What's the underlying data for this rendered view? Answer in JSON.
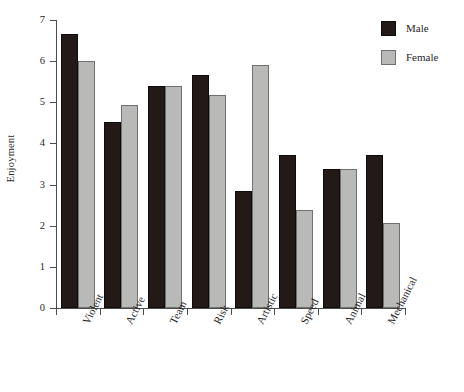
{
  "chart_data": {
    "type": "bar",
    "title": "",
    "subtitle": "",
    "xlabel": "",
    "ylabel": "Enjoyment",
    "ylim": [
      0,
      7
    ],
    "ytick_labels": [
      "0",
      "1",
      "2",
      "3",
      "4",
      "5",
      "6",
      "7"
    ],
    "ytick_values": [
      0,
      1,
      2,
      3,
      4,
      5,
      6,
      7
    ],
    "grid": false,
    "legend_position": "top-right",
    "categories": [
      "Violent",
      "Active",
      "Team",
      "Risk",
      "Artistic",
      "Speed",
      "Animal",
      "Mechanical"
    ],
    "series": [
      {
        "name": "Male",
        "color": "#231a18",
        "values": [
          6.66,
          4.53,
          5.4,
          5.66,
          2.84,
          3.72,
          3.38,
          3.72
        ]
      },
      {
        "name": "Female",
        "color": "#b9bab8",
        "values": [
          6.0,
          4.93,
          5.4,
          5.18,
          5.9,
          2.38,
          3.38,
          2.07
        ]
      }
    ]
  },
  "legend": {
    "items": [
      {
        "label": "Male",
        "swatch": "legend-swatch-male"
      },
      {
        "label": "Female",
        "swatch": "legend-swatch-female"
      }
    ]
  },
  "caption": {
    "clipped_text": ""
  }
}
